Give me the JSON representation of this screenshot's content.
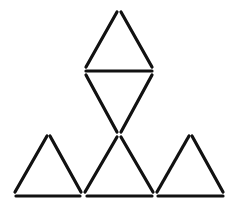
{
  "diagram": {
    "type": "matchstick-puzzle",
    "background": "#ffffff",
    "stroke_color": "#111111",
    "stick_count": 14,
    "triangle_count": 5,
    "sticks": [
      {
        "id": "top-left",
        "x1": 117,
        "y1": 12,
        "x2": 86,
        "y2": 67
      },
      {
        "id": "top-right",
        "x1": 121,
        "y1": 12,
        "x2": 152,
        "y2": 67
      },
      {
        "id": "middle-horizontal",
        "x1": 86,
        "y1": 71,
        "x2": 152,
        "y2": 71
      },
      {
        "id": "inverted-left",
        "x1": 86,
        "y1": 75,
        "x2": 117,
        "y2": 132
      },
      {
        "id": "inverted-right",
        "x1": 152,
        "y1": 75,
        "x2": 121,
        "y2": 132
      },
      {
        "id": "bl-left",
        "x1": 47,
        "y1": 136,
        "x2": 15,
        "y2": 192
      },
      {
        "id": "bl-right",
        "x1": 50,
        "y1": 136,
        "x2": 81,
        "y2": 192
      },
      {
        "id": "bl-base",
        "x1": 16,
        "y1": 196,
        "x2": 80,
        "y2": 196
      },
      {
        "id": "bm-left",
        "x1": 117,
        "y1": 137,
        "x2": 85,
        "y2": 192
      },
      {
        "id": "bm-right",
        "x1": 121,
        "y1": 137,
        "x2": 153,
        "y2": 192
      },
      {
        "id": "bm-base",
        "x1": 87,
        "y1": 196,
        "x2": 152,
        "y2": 196
      },
      {
        "id": "br-left",
        "x1": 189,
        "y1": 136,
        "x2": 157,
        "y2": 192
      },
      {
        "id": "br-right",
        "x1": 192,
        "y1": 136,
        "x2": 223,
        "y2": 192
      },
      {
        "id": "br-base",
        "x1": 158,
        "y1": 196,
        "x2": 223,
        "y2": 196
      }
    ]
  }
}
